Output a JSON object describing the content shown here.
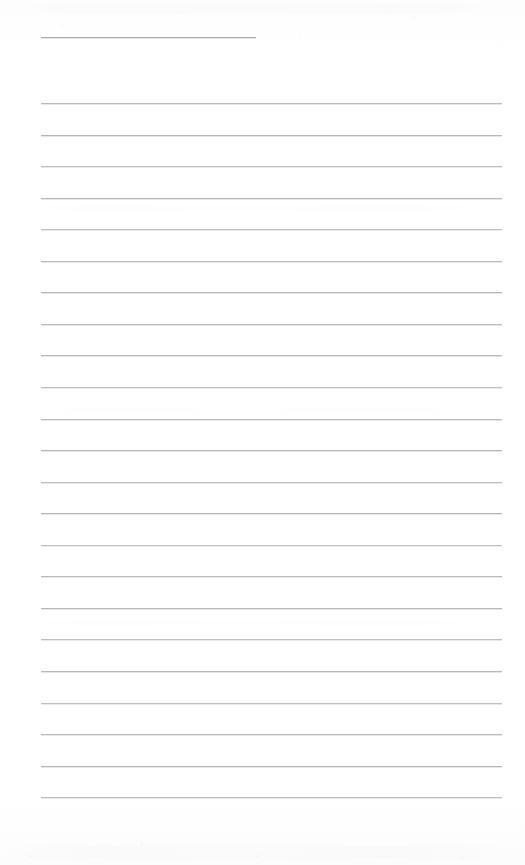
{
  "document": {
    "kind": "scanned-lined-notebook-page",
    "title": "",
    "page_width": 525,
    "page_height": 865,
    "background_color": "#fefefe",
    "text_content": "",
    "is_blank": true,
    "notes": ""
  },
  "ruling": {
    "line_color": "#b6b6b9",
    "title_rule_color": "#a9a9ad",
    "line_thickness_px": 1,
    "left_margin_px": 41,
    "right_edge_px": 502,
    "line_spacing_px": 31.55,
    "first_body_line_y_px": 103,
    "last_body_line_y_px": 797,
    "body_line_count": 23,
    "title_rule": {
      "y_px": 37,
      "x_start_px": 41,
      "x_end_px": 256,
      "length_px": 215
    },
    "body_lines": [
      {
        "index": 1,
        "y_px": 103.0
      },
      {
        "index": 2,
        "y_px": 134.6
      },
      {
        "index": 3,
        "y_px": 166.1
      },
      {
        "index": 4,
        "y_px": 197.7
      },
      {
        "index": 5,
        "y_px": 229.2
      },
      {
        "index": 6,
        "y_px": 260.8
      },
      {
        "index": 7,
        "y_px": 292.3
      },
      {
        "index": 8,
        "y_px": 323.9
      },
      {
        "index": 9,
        "y_px": 355.4
      },
      {
        "index": 10,
        "y_px": 387.0
      },
      {
        "index": 11,
        "y_px": 418.5
      },
      {
        "index": 12,
        "y_px": 450.1
      },
      {
        "index": 13,
        "y_px": 481.6
      },
      {
        "index": 14,
        "y_px": 513.2
      },
      {
        "index": 15,
        "y_px": 544.7
      },
      {
        "index": 16,
        "y_px": 576.3
      },
      {
        "index": 17,
        "y_px": 607.8
      },
      {
        "index": 18,
        "y_px": 639.4
      },
      {
        "index": 19,
        "y_px": 670.9
      },
      {
        "index": 20,
        "y_px": 702.5
      },
      {
        "index": 21,
        "y_px": 734.0
      },
      {
        "index": 22,
        "y_px": 765.6
      },
      {
        "index": 23,
        "y_px": 797.1
      }
    ]
  },
  "scan_artifacts": {
    "bands": [
      {
        "y_px": 4,
        "height_px": 10,
        "opacity": 0.45
      },
      {
        "y_px": 205,
        "height_px": 6,
        "opacity": 0.3
      },
      {
        "y_px": 408,
        "height_px": 5,
        "opacity": 0.22
      },
      {
        "y_px": 620,
        "height_px": 6,
        "opacity": 0.26
      },
      {
        "y_px": 845,
        "height_px": 14,
        "opacity": 0.5
      }
    ]
  }
}
